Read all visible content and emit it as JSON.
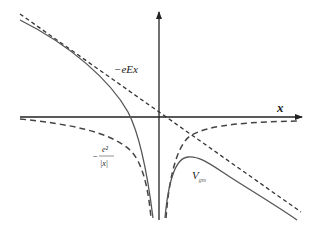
{
  "diagram": {
    "title": "",
    "labels": {
      "field_potential": "−eEx",
      "x_axis": "x",
      "coulomb_numerator": "e²",
      "coulomb_minus": "−",
      "coulomb_denominator": "|x|",
      "total_potential_main": "V",
      "total_potential_sub": "gm"
    },
    "curves": [
      {
        "name": "field-potential-line",
        "style": "dashed",
        "description": "−eEx straight line"
      },
      {
        "name": "coulomb-potential-curve",
        "style": "dashed",
        "description": "−e²/|x|"
      },
      {
        "name": "total-potential-curve",
        "style": "solid",
        "description": "V_gm"
      }
    ],
    "axes": {
      "x_arrow": true,
      "y_arrow": true
    },
    "colors": {
      "axis": "#222222",
      "curve": "#444444",
      "background": "#ffffff"
    }
  }
}
